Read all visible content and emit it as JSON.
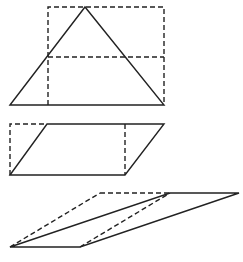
{
  "diagram": {
    "title": "",
    "colors": {
      "line": "#222222",
      "background": "#ffffff"
    },
    "figures": [
      {
        "name": "triangle-with-rectangle",
        "solid_shapes": [
          "triangle"
        ],
        "dashed_shapes": [
          "rectangle",
          "midline"
        ]
      },
      {
        "name": "parallelogram-to-rectangle",
        "solid_shapes": [
          "parallelogram"
        ],
        "dashed_shapes": [
          "left-corner",
          "right-vertical"
        ]
      },
      {
        "name": "sheared-parallelograms",
        "solid_shapes": [
          "parallelogram-thin"
        ],
        "dashed_shapes": [
          "parallelogram-outline"
        ]
      }
    ]
  }
}
